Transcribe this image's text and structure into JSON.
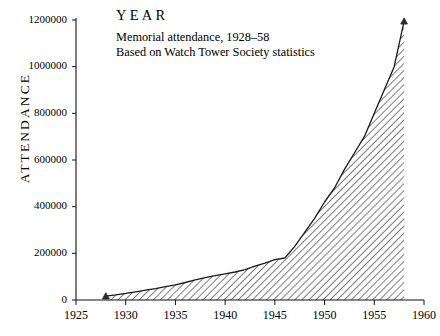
{
  "chart_data": {
    "type": "area",
    "title": "YEAR",
    "subtitles": [
      "Memorial attendance, 1928–58",
      "Based on Watch Tower Society statistics"
    ],
    "xlabel": "",
    "ylabel": "ATTENDANCE",
    "xlim": [
      1925,
      1960
    ],
    "ylim": [
      0,
      1200000
    ],
    "xticks": [
      1925,
      1930,
      1935,
      1940,
      1945,
      1950,
      1955,
      1960
    ],
    "yticks": [
      0,
      200000,
      400000,
      600000,
      800000,
      1000000,
      1200000
    ],
    "grid": false,
    "legend": null,
    "fill": "diagonal-hatch",
    "marker_points": [
      {
        "x": 1928,
        "y": 17000
      },
      {
        "x": 1958,
        "y": 1195000
      }
    ],
    "x": [
      1928,
      1929,
      1930,
      1931,
      1932,
      1933,
      1934,
      1935,
      1936,
      1937,
      1938,
      1939,
      1940,
      1941,
      1942,
      1943,
      1944,
      1945,
      1946,
      1947,
      1948,
      1949,
      1950,
      1951,
      1952,
      1953,
      1954,
      1955,
      1956,
      1957,
      1958
    ],
    "values": [
      17000,
      22000,
      28000,
      35000,
      42000,
      49000,
      57000,
      65000,
      75000,
      86000,
      96000,
      104000,
      112000,
      120000,
      130000,
      145000,
      158000,
      173000,
      180000,
      230000,
      290000,
      350000,
      420000,
      480000,
      560000,
      630000,
      700000,
      800000,
      900000,
      1000000,
      1195000
    ]
  },
  "axis": {
    "y_tick_labels": [
      "0",
      "200000",
      "400000",
      "600000",
      "800000",
      "1000000",
      "1200000"
    ],
    "x_tick_labels": [
      "1925",
      "1930",
      "1935",
      "1940",
      "1945",
      "1950",
      "1955",
      "1960"
    ]
  }
}
